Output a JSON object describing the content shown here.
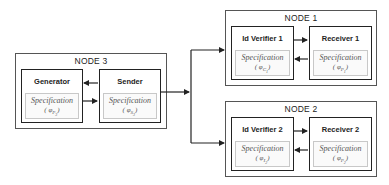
{
  "nodes": {
    "node3": {
      "title": "NODE 3",
      "generator": {
        "title": "Generator",
        "spec_label": "Specification",
        "spec_symbol": "φ",
        "spec_sub": "P",
        "spec_subsub": "3"
      },
      "sender": {
        "title": "Sender",
        "spec_label": "Specification",
        "spec_symbol": "φ",
        "spec_sub": "S",
        "spec_subsub": "3"
      }
    },
    "node1": {
      "title": "NODE 1",
      "verifier": {
        "title": "Id Verifier 1",
        "spec_label": "Specification",
        "spec_symbol": "φ",
        "spec_sub": "C",
        "spec_subsub": "1"
      },
      "receiver": {
        "title": "Receiver 1",
        "spec_label": "Specification",
        "spec_symbol": "φ",
        "spec_sub": "P",
        "spec_subsub": "1"
      }
    },
    "node2": {
      "title": "NODE 2",
      "verifier": {
        "title": "Id Verifier 2",
        "spec_label": "Specification",
        "spec_symbol": "φ",
        "spec_sub": "I",
        "spec_subsub": "2"
      },
      "receiver": {
        "title": "Receiver 2",
        "spec_label": "Specification",
        "spec_symbol": "φ",
        "spec_sub": "P",
        "spec_subsub": "2"
      }
    }
  },
  "paren_open": "(",
  "paren_close": ")"
}
